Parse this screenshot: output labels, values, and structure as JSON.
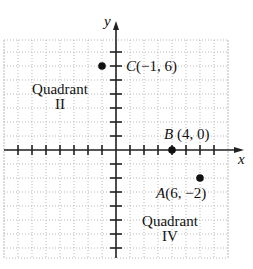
{
  "chart_data": {
    "type": "scatter",
    "title": "",
    "xlabel": "x",
    "ylabel": "y",
    "xlim": [
      -8,
      8
    ],
    "ylim": [
      -8,
      8
    ],
    "grid": true,
    "points": [
      {
        "name": "A",
        "x": 6,
        "y": -2,
        "label": "A(6, −2)"
      },
      {
        "name": "B",
        "x": 4,
        "y": 0,
        "label": "B(4, 0)"
      },
      {
        "name": "C",
        "x": -1,
        "y": 6,
        "label": "C(−1, 6)"
      }
    ],
    "annotations": [
      {
        "text": "Quadrant II",
        "quadrant": 2
      },
      {
        "text": "Quadrant IV",
        "quadrant": 4
      }
    ]
  },
  "axes": {
    "x_label": "x",
    "y_label": "y"
  },
  "points": {
    "A": {
      "letter": "A",
      "coords": "(6, −2)"
    },
    "B": {
      "letter": "B",
      "coords": " (4, 0)"
    },
    "C": {
      "letter": "C",
      "coords": "(−1, 6)"
    }
  },
  "quadrants": {
    "q2": {
      "line1": "Quadrant",
      "line2": "II"
    },
    "q4": {
      "line1": "Quadrant",
      "line2": "IV"
    }
  },
  "colors": {
    "ink": "#111111",
    "grid": "#9a9a9a"
  }
}
